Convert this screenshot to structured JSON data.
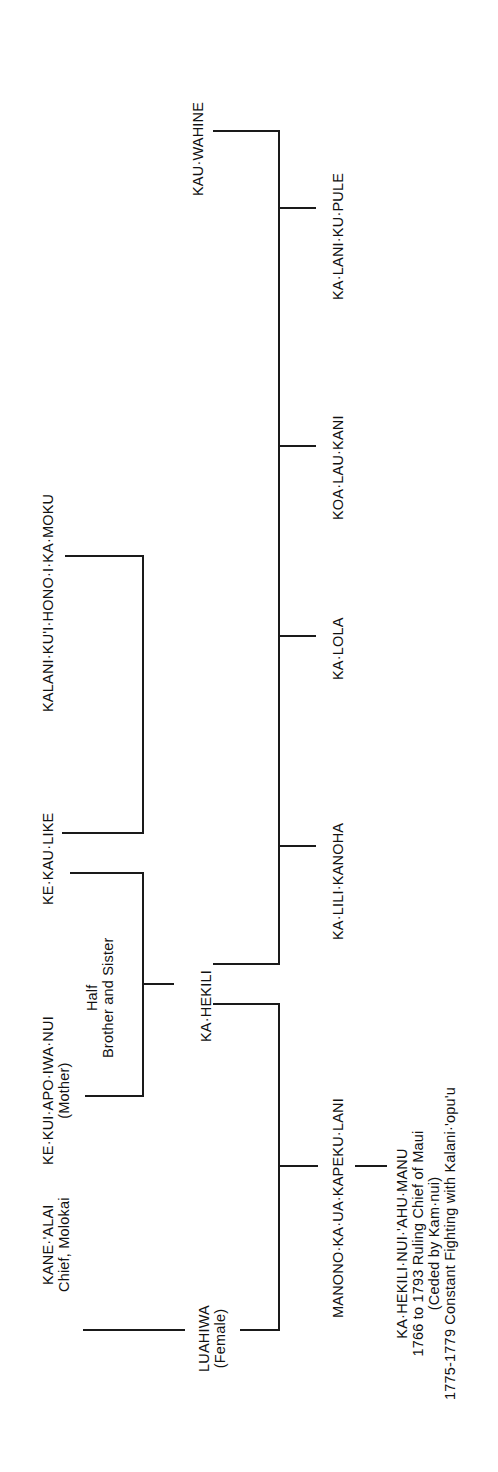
{
  "chart_title": "",
  "people": {
    "kanealai": {
      "name": "KANE·'ALAI",
      "note": "Chief, Molokai"
    },
    "kekuiapoiwanui": {
      "name": "KE·KUI·APO·IWA·NUI",
      "note": "(Mother)"
    },
    "kekaulike": {
      "name": "KE·KAU·LIKE"
    },
    "kalanikuihonoikamoku": {
      "name": "KALANI·KU'I·HONO·I·KA·MOKU"
    },
    "luahiwa": {
      "name": "LUAHIWA",
      "note": "(Female)"
    },
    "kahekili": {
      "name": "KA·HEKILI"
    },
    "kauwahine": {
      "name": "KAU·WAHINE"
    },
    "manono": {
      "name": "MANONO·KA·UA·KAPEKU·LANI"
    },
    "kalilikanoha": {
      "name": "KA·LILI·KANOHA"
    },
    "kalola": {
      "name": "KA·LOLA"
    },
    "koalaukani": {
      "name": "KOA·LAU·KANI"
    },
    "kalanikupule": {
      "name": "KA·LANI·KU·PULE"
    },
    "kahekilinui": {
      "name": "KA·HEKILI·NUI·'AHU·MANU",
      "line2": "1766 to 1793 Ruling Chief of Maui",
      "line3": "(Ceded by Kam·nui)",
      "line4": "1775-1779 Constant Fighting with Kalani·'opu'u"
    }
  },
  "annotations": {
    "half_siblings": {
      "line1": "Half",
      "line2": "Brother and Sister"
    }
  },
  "colors": {
    "line": "#1a1a1a",
    "text": "#111111",
    "background": "#ffffff"
  }
}
